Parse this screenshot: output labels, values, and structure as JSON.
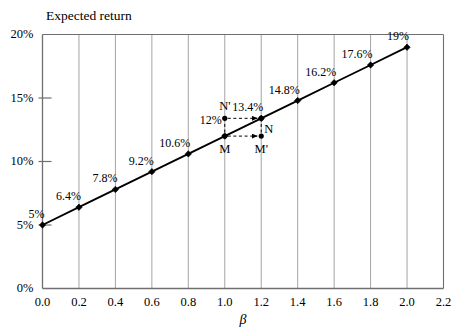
{
  "chart_data": {
    "type": "line",
    "title": "",
    "ylabel": "Expected return",
    "xlabel": "β",
    "xlim": [
      0.0,
      2.2
    ],
    "ylim": [
      0,
      20
    ],
    "grid": true,
    "legend": "none",
    "x": [
      0.0,
      0.2,
      0.4,
      0.6,
      0.8,
      1.0,
      1.2,
      1.4,
      1.6,
      1.8,
      2.0
    ],
    "values": [
      5,
      6.4,
      7.8,
      9.2,
      10.6,
      12,
      13.4,
      14.8,
      16.2,
      17.6,
      19
    ],
    "point_labels": [
      "5%",
      "6.4%",
      "7.8%",
      "9.2%",
      "10.6%",
      "12%",
      "13.4%",
      "14.8%",
      "16.2%",
      "17.6%",
      "19%"
    ],
    "xticks": [
      "0.0",
      "0.2",
      "0.4",
      "0.6",
      "0.8",
      "1.0",
      "1.2",
      "1.4",
      "1.6",
      "1.8",
      "2.0",
      "2.2"
    ],
    "xtick_values": [
      0.0,
      0.2,
      0.4,
      0.6,
      0.8,
      1.0,
      1.2,
      1.4,
      1.6,
      1.8,
      2.0,
      2.2
    ],
    "yticks": [
      "0%",
      "5%",
      "10%",
      "15%",
      "20%"
    ],
    "ytick_values": [
      0,
      5,
      10,
      15,
      20
    ],
    "annotations": [
      {
        "name": "N-prime",
        "label": "N'",
        "x": 1.0,
        "y": 13.4
      },
      {
        "name": "N",
        "label": "N",
        "x": 1.2,
        "y": 13.4
      },
      {
        "name": "M",
        "label": "M",
        "x": 1.0,
        "y": 12.0
      },
      {
        "name": "M-prime",
        "label": "M'",
        "x": 1.2,
        "y": 12.0
      }
    ],
    "arrows": [
      {
        "name": "arrow-n-prime-to-n",
        "from_x": 1.0,
        "to_x": 1.2,
        "y": 13.4,
        "style": "dashed"
      },
      {
        "name": "arrow-m-to-m-prime",
        "from_x": 1.0,
        "to_x": 1.2,
        "y": 12.0,
        "style": "dashed"
      }
    ],
    "colors": {
      "line": "#000000",
      "grid": "#9a9a9a",
      "axis": "#6f6f6f",
      "background": "#ffffff",
      "text": "#000000"
    }
  }
}
